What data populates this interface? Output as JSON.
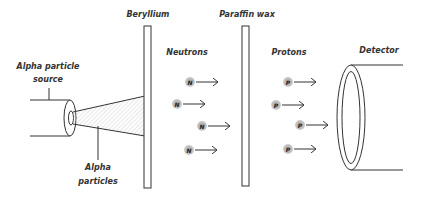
{
  "labels": {
    "beryllium": "Beryllium",
    "paraffin": "Paraffin wax",
    "neutrons": "Neutrons",
    "protons": "Protons",
    "detector": "Detector",
    "source_line1": "Alpha particle",
    "source_line2": "source",
    "alpha_line1": "Alpha",
    "alpha_line2": "particles"
  },
  "particles": {
    "neutron_symbol": "N",
    "proton_symbol": "P",
    "neutron_count": 4,
    "proton_count": 4
  },
  "colors": {
    "stroke": "#333333",
    "particle_fill": "#bdbdbd",
    "hatch": "#cfcfcf"
  }
}
